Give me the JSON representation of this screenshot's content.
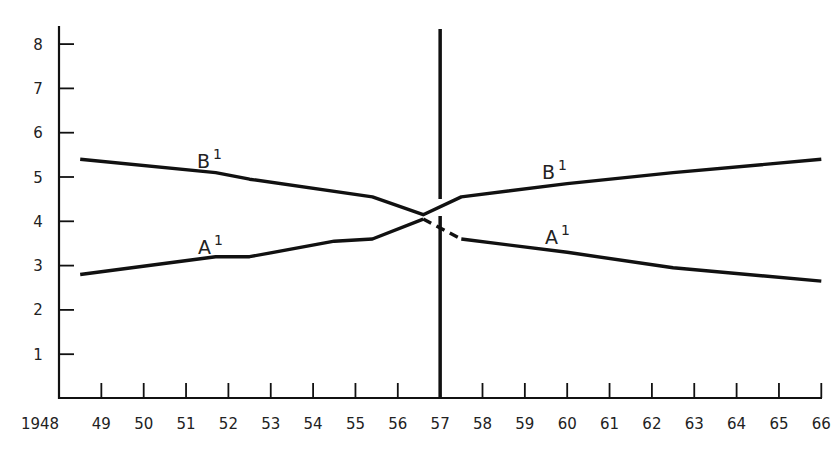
{
  "chart_data": {
    "type": "line",
    "title": "",
    "xlabel": "",
    "ylabel": "",
    "xlim": [
      1948,
      1966
    ],
    "ylim": [
      0,
      8.5
    ],
    "grid": false,
    "legend": "inline labels",
    "x_tick_labels": [
      "1948",
      "49",
      "50",
      "51",
      "52",
      "53",
      "54",
      "55",
      "56",
      "57",
      "58",
      "59",
      "60",
      "61",
      "62",
      "63",
      "64",
      "65",
      "66"
    ],
    "y_tick_labels": [
      "1",
      "2",
      "3",
      "4",
      "5",
      "6",
      "7",
      "8"
    ],
    "y_ticks": [
      1,
      2,
      3,
      4,
      5,
      6,
      7,
      8
    ],
    "x_ticks": [
      1948,
      1949,
      1950,
      1951,
      1952,
      1953,
      1954,
      1955,
      1956,
      1957,
      1958,
      1959,
      1960,
      1961,
      1962,
      1963,
      1964,
      1965,
      1966
    ],
    "vertical_marker": {
      "x": 1957,
      "label": "57"
    },
    "series": [
      {
        "name": "B1",
        "label": "B",
        "superscript": "1",
        "label_pos": {
          "x": 1951.5,
          "y": 5.15
        },
        "segments": [
          {
            "style": "solid",
            "points": [
              [
                1948.5,
                5.4
              ],
              [
                1951.7,
                5.1
              ],
              [
                1952.5,
                4.95
              ],
              [
                1955.4,
                4.55
              ],
              [
                1956.6,
                4.15
              ],
              [
                1957.5,
                4.55
              ],
              [
                1960,
                4.85
              ],
              [
                1962.5,
                5.1
              ],
              [
                1966,
                5.4
              ]
            ]
          }
        ]
      },
      {
        "name": "A1",
        "label": "A",
        "superscript": "1",
        "label_pos": {
          "x": 1951.5,
          "y": 3.3
        },
        "label_pos_2": {
          "x": 1959.5,
          "y": 3.45
        },
        "segments": [
          {
            "style": "solid",
            "points": [
              [
                1948.5,
                2.8
              ],
              [
                1951.7,
                3.2
              ],
              [
                1952.5,
                3.2
              ],
              [
                1954.5,
                3.55
              ],
              [
                1955.4,
                3.6
              ],
              [
                1956.6,
                4.05
              ]
            ]
          },
          {
            "style": "dashed",
            "points": [
              [
                1956.6,
                4.05
              ],
              [
                1957.5,
                3.6
              ]
            ]
          },
          {
            "style": "solid",
            "points": [
              [
                1957.5,
                3.6
              ],
              [
                1960,
                3.3
              ],
              [
                1962.5,
                2.95
              ],
              [
                1966,
                2.65
              ]
            ]
          }
        ]
      }
    ],
    "labels": {
      "B_left": {
        "text": "B",
        "sup": "1"
      },
      "B_right": {
        "text": "B",
        "sup": "1"
      },
      "A_left": {
        "text": "A",
        "sup": "1"
      },
      "A_right": {
        "text": "A",
        "sup": "1"
      }
    },
    "colors": {
      "line": "#111111",
      "axis": "#111111",
      "text": "#222222",
      "background": "#ffffff"
    }
  }
}
